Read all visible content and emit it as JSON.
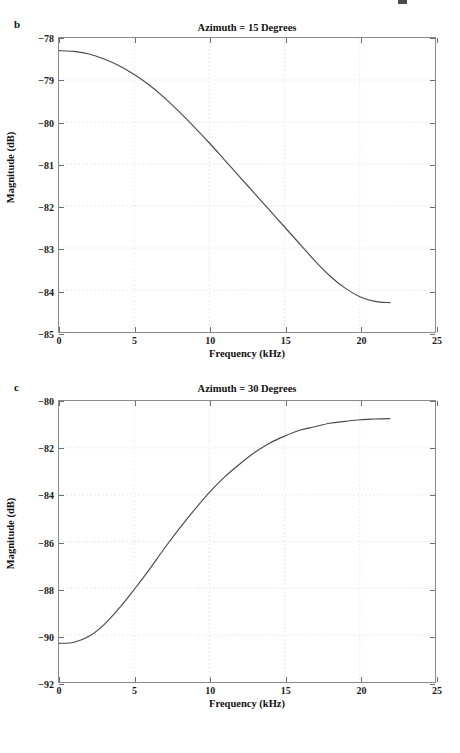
{
  "figure": {
    "background_color": "#ffffff",
    "axis_color": "#8a8a8a",
    "grid_color": "#cfcfcf",
    "line_color": "#4a4a4a",
    "text_color": "#111111"
  },
  "panels": [
    {
      "letter": "b",
      "title": "Azimuth = 15 Degrees",
      "xlabel": "Frequency (kHz)",
      "ylabel": "Magnitude (dB)"
    },
    {
      "letter": "c",
      "title": "Azimuth = 30 Degrees",
      "xlabel": "Frequency (kHz)",
      "ylabel": "Magnitude (dB)"
    }
  ],
  "chart_data": [
    {
      "type": "line",
      "title": "Azimuth = 15 Degrees",
      "panel_letter": "b",
      "xlabel": "Frequency (kHz)",
      "ylabel": "Magnitude (dB)",
      "xlim": [
        0,
        25
      ],
      "ylim": [
        -85,
        -78
      ],
      "xticks": [
        0,
        5,
        10,
        15,
        20,
        25
      ],
      "xtick_labels": [
        "0",
        "5",
        "10",
        "15",
        "20",
        "25"
      ],
      "yticks": [
        -85,
        -84,
        -83,
        -82,
        -81,
        -80,
        -79,
        -78
      ],
      "ytick_labels": [
        "-85",
        "-84",
        "-83",
        "-82",
        "-81",
        "-80",
        "-79",
        "-78"
      ],
      "grid": true,
      "grid_style": "dotted",
      "legend": null,
      "series": [
        {
          "name": "Magnitude at 15 degrees azimuth",
          "x": [
            0,
            1,
            2,
            3,
            4,
            5,
            6,
            7,
            8,
            9,
            10,
            11,
            12,
            13,
            14,
            15,
            16,
            17,
            18,
            19,
            20,
            21,
            22
          ],
          "y": [
            -78.3,
            -78.32,
            -78.38,
            -78.5,
            -78.66,
            -78.87,
            -79.12,
            -79.42,
            -79.76,
            -80.12,
            -80.5,
            -80.9,
            -81.3,
            -81.7,
            -82.1,
            -82.5,
            -82.9,
            -83.3,
            -83.66,
            -83.95,
            -84.16,
            -84.27,
            -84.3
          ]
        }
      ]
    },
    {
      "type": "line",
      "title": "Azimuth = 30 Degrees",
      "panel_letter": "c",
      "xlabel": "Frequency (kHz)",
      "ylabel": "Magnitude (dB)",
      "xlim": [
        0,
        25
      ],
      "ylim": [
        -92,
        -80
      ],
      "xticks": [
        0,
        5,
        10,
        15,
        20,
        25
      ],
      "xtick_labels": [
        "0",
        "5",
        "10",
        "15",
        "20",
        "25"
      ],
      "yticks": [
        -92,
        -90,
        -88,
        -86,
        -84,
        -82,
        -80
      ],
      "ytick_labels": [
        "-92",
        "-90",
        "-88",
        "-86",
        "-84",
        "-82",
        "-80"
      ],
      "grid": true,
      "grid_style": "dotted",
      "legend": null,
      "series": [
        {
          "name": "Magnitude at 30 degrees azimuth",
          "x": [
            0,
            1,
            2,
            3,
            4,
            5,
            6,
            7,
            8,
            9,
            10,
            11,
            12,
            13,
            14,
            15,
            16,
            17,
            18,
            19,
            20,
            21,
            22
          ],
          "y": [
            -90.35,
            -90.3,
            -90.05,
            -89.55,
            -88.85,
            -88.05,
            -87.2,
            -86.3,
            -85.45,
            -84.65,
            -83.9,
            -83.25,
            -82.7,
            -82.2,
            -81.8,
            -81.5,
            -81.25,
            -81.1,
            -80.95,
            -80.87,
            -80.8,
            -80.77,
            -80.75
          ]
        }
      ]
    }
  ]
}
